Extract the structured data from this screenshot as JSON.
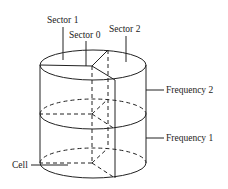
{
  "diagram": {
    "type": "cylinder-sector-frequency",
    "labels": {
      "sector1": "Sector 1",
      "sector0": "Sector 0",
      "sector2": "Sector 2",
      "frequency2": "Frequency 2",
      "frequency1": "Frequency 1",
      "cell": "Cell"
    },
    "colors": {
      "line": "#222222",
      "background": "#ffffff"
    }
  }
}
